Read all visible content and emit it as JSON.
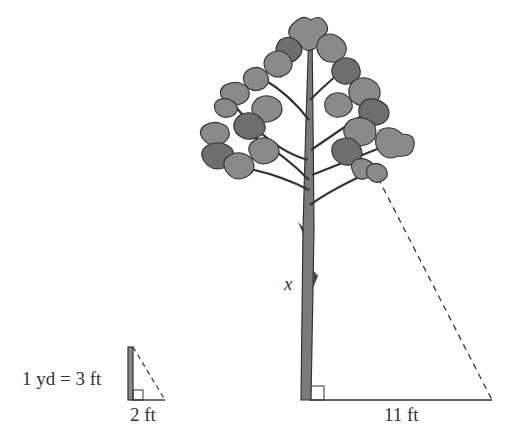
{
  "diagram": {
    "type": "similar-triangles",
    "labels": {
      "unit_conversion": "1 yd = 3 ft",
      "small_base": "2 ft",
      "large_base": "11 ft",
      "tree_height": "x"
    },
    "colors": {
      "line": "#333333",
      "foliage": "#8a8a8a",
      "foliage_dark": "#6e6e6e",
      "trunk": "#7a7a7a"
    }
  }
}
